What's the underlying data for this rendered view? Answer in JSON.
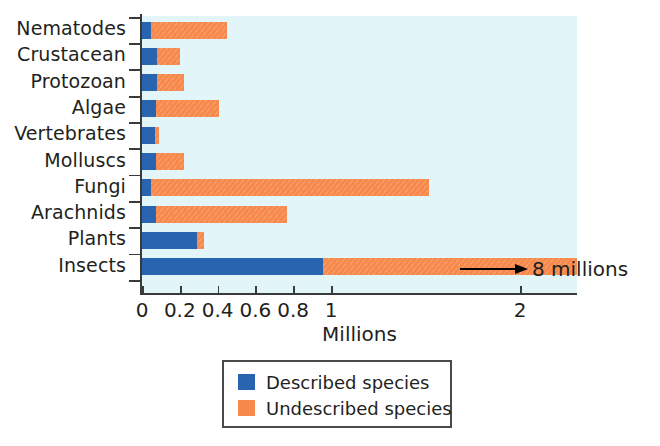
{
  "chart_data": {
    "type": "bar",
    "orientation": "horizontal",
    "stacked": true,
    "title": "",
    "xlabel": "Millions",
    "ylabel": "",
    "xlim": [
      0,
      2.3
    ],
    "xticks": [
      0,
      0.2,
      0.4,
      0.6,
      0.8,
      1,
      2
    ],
    "xtick_labels": [
      "0",
      "0.2",
      "0.4",
      "0.6",
      "0.8",
      "1",
      "2"
    ],
    "grid": false,
    "legend_position": "bottom-center",
    "categories": [
      "Nematodes",
      "Crustacean",
      "Protozoan",
      "Algae",
      "Vertebrates",
      "Molluscs",
      "Fungi",
      "Arachnids",
      "Plants",
      "Insects"
    ],
    "series": [
      {
        "name": "Described species",
        "color": "#2864b0",
        "values": [
          0.05,
          0.08,
          0.08,
          0.075,
          0.07,
          0.075,
          0.05,
          0.075,
          0.29,
          0.96
        ]
      },
      {
        "name": "Undescribed species",
        "color": "#f6894b",
        "values": [
          0.4,
          0.12,
          0.14,
          0.33,
          0.02,
          0.145,
          1.47,
          0.69,
          0.04,
          1.34
        ]
      }
    ],
    "totals": [
      0.45,
      0.2,
      0.22,
      0.405,
      0.09,
      0.22,
      1.52,
      0.765,
      0.33,
      2.3
    ],
    "annotations": [
      {
        "text": "8 millions",
        "target_category": "Insects",
        "arrow": true,
        "note": "Insects bar is truncated at the plot edge; arrow indicates the true total"
      }
    ],
    "plot_background": "#e2f6f9",
    "axis_color": "#3a3a3a",
    "text_color": "#231f20"
  },
  "legend": {
    "items": [
      {
        "label": "Described species",
        "color": "#2864b0"
      },
      {
        "label": "Undescribed species",
        "color": "#f6894b"
      }
    ]
  },
  "annotation": {
    "text": "8 millions"
  },
  "axis": {
    "x_title": "Millions"
  }
}
